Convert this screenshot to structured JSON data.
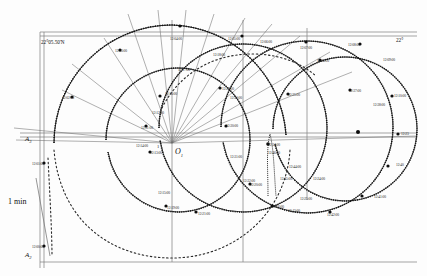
{
  "figure": {
    "type": "navigation-trajectory-plot",
    "background_color": "#fdfdfd",
    "stroke_color": "#1a1a1a",
    "grid_color": "#8a8a8a"
  },
  "axes": {
    "top_left_label": "22°05.50'N",
    "top_right_label": "22°",
    "left_upper_label": "A",
    "left_upper_sub": "3",
    "left_lower_label": "A",
    "left_lower_sub": "2",
    "scale_label": "1 min",
    "origin_label": "O",
    "origin_sub": "1",
    "small_one": "1"
  },
  "time_labels": [
    {
      "text": "12:00:00",
      "x": 32,
      "y": 246
    },
    {
      "text": "12:01:00",
      "x": 32,
      "y": 163
    },
    {
      "text": "12:02:00",
      "x": 62,
      "y": 97
    },
    {
      "text": "12:03:00",
      "x": 115,
      "y": 50
    },
    {
      "text": "12:04:00",
      "x": 170,
      "y": 38
    },
    {
      "text": "12:05:00",
      "x": 228,
      "y": 38
    },
    {
      "text": "12:06:00",
      "x": 260,
      "y": 41
    },
    {
      "text": "12:07:00",
      "x": 300,
      "y": 47
    },
    {
      "text": "12:08:00",
      "x": 348,
      "y": 44
    },
    {
      "text": "12:09:00",
      "x": 383,
      "y": 59
    },
    {
      "text": "12:10:00",
      "x": 394,
      "y": 95
    },
    {
      "text": "12:23",
      "x": 401,
      "y": 133
    },
    {
      "text": "12:40",
      "x": 396,
      "y": 164
    },
    {
      "text": "12:41:00",
      "x": 374,
      "y": 196
    },
    {
      "text": "12:42:00",
      "x": 327,
      "y": 214
    },
    {
      "text": "12:43:00",
      "x": 288,
      "y": 210
    },
    {
      "text": "12:24:00",
      "x": 313,
      "y": 178
    },
    {
      "text": "12:25:00",
      "x": 300,
      "y": 198
    },
    {
      "text": "12:26:00",
      "x": 272,
      "y": 206
    },
    {
      "text": "12:45:00",
      "x": 280,
      "y": 178
    },
    {
      "text": "12:44:00",
      "x": 289,
      "y": 166
    },
    {
      "text": "12:46:00",
      "x": 268,
      "y": 152
    },
    {
      "text": "12:20:00",
      "x": 250,
      "y": 184
    },
    {
      "text": "12:21:00",
      "x": 198,
      "y": 213
    },
    {
      "text": "12:19:00",
      "x": 167,
      "y": 207
    },
    {
      "text": "12:15:00",
      "x": 158,
      "y": 192
    },
    {
      "text": "12:13:00",
      "x": 150,
      "y": 152
    },
    {
      "text": "12:14:00",
      "x": 136,
      "y": 145
    },
    {
      "text": "12:11:00",
      "x": 141,
      "y": 127
    },
    {
      "text": "12:12:00",
      "x": 152,
      "y": 112
    },
    {
      "text": "12:16:00",
      "x": 165,
      "y": 93
    },
    {
      "text": "12:17:00",
      "x": 178,
      "y": 69
    },
    {
      "text": "12:18:00",
      "x": 213,
      "y": 54
    },
    {
      "text": "12:22:00",
      "x": 222,
      "y": 88
    },
    {
      "text": "12:30:00",
      "x": 226,
      "y": 125
    },
    {
      "text": "12:31:00",
      "x": 230,
      "y": 156
    },
    {
      "text": "12:32:00",
      "x": 243,
      "y": 180
    },
    {
      "text": "12:33:00",
      "x": 230,
      "y": 97
    },
    {
      "text": "12:34:00",
      "x": 268,
      "y": 144
    },
    {
      "text": "12:35:00",
      "x": 288,
      "y": 94
    },
    {
      "text": "12:36:00",
      "x": 317,
      "y": 60
    },
    {
      "text": "12:37:00",
      "x": 349,
      "y": 90
    },
    {
      "text": "12:38:00",
      "x": 373,
      "y": 104
    }
  ],
  "chart_data": {
    "type": "scatter",
    "title": "",
    "xlabel": "",
    "ylabel": "",
    "series": [
      {
        "name": "arc-outer-left",
        "center": [
          172,
          143
        ],
        "radius": 118,
        "from_deg": 182,
        "to_deg": 358,
        "style": "beaded"
      },
      {
        "name": "arc-inner-left",
        "center": [
          178,
          140
        ],
        "radius": 72,
        "from_deg": 175,
        "to_deg": 360,
        "style": "beaded"
      },
      {
        "name": "arc-mid",
        "center": [
          243,
          128
        ],
        "radius": 84,
        "from_deg": 195,
        "to_deg": 360,
        "style": "beaded"
      },
      {
        "name": "arc-right",
        "center": [
          307,
          127
        ],
        "radius": 86,
        "from_deg": 190,
        "to_deg": 370,
        "style": "beaded"
      },
      {
        "name": "arc-far-right",
        "center": [
          345,
          129
        ],
        "radius": 72,
        "from_deg": 200,
        "to_deg": 380,
        "style": "beaded"
      },
      {
        "name": "dotted-lower",
        "center": [
          172,
          143
        ],
        "radius": 118,
        "from_deg": 10,
        "to_deg": 170,
        "style": "dotted"
      },
      {
        "name": "dotted-upper",
        "center": [
          243,
          128
        ],
        "radius": 84,
        "from_deg": 200,
        "to_deg": 340,
        "style": "dotted"
      }
    ],
    "radial_lines_count": 14,
    "radial_origin": [
      172,
      143
    ]
  }
}
